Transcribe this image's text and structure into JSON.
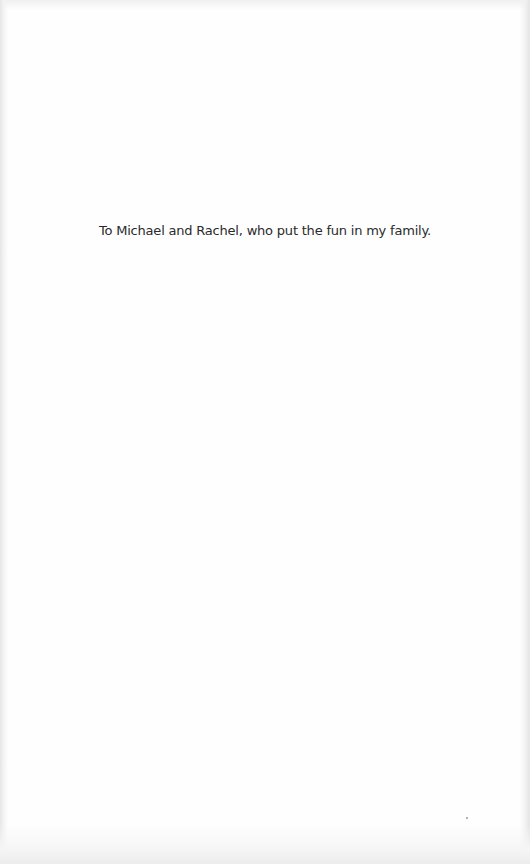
{
  "page": {
    "type": "dedication",
    "dedication_text": "To Michael and Rachel, who put the fun in my family.",
    "background_color": "#fefefe",
    "text_color": "#2a2a2a"
  }
}
